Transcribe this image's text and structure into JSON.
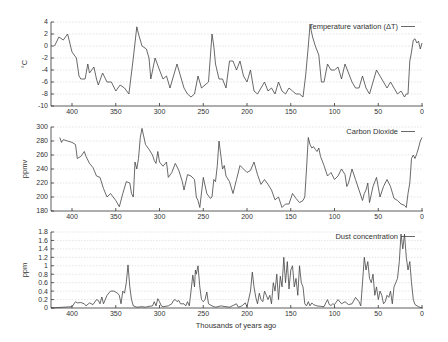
{
  "chart_data": [
    {
      "type": "line",
      "title": "",
      "legend": "Temperature variation (ΔT)",
      "xlabel": "",
      "ylabel": "°C",
      "xlim": [
        424,
        0
      ],
      "ylim": [
        -10,
        4
      ],
      "xticks": [
        400,
        350,
        300,
        250,
        200,
        150,
        100,
        50,
        0
      ],
      "yticks": [
        4,
        2,
        0,
        -2,
        -4,
        -6,
        -8,
        -10
      ],
      "grid": true,
      "legend_position": "top-right",
      "x": [
        420,
        415,
        410,
        405,
        400,
        395,
        392,
        390,
        385,
        382,
        380,
        375,
        372,
        370,
        365,
        360,
        355,
        350,
        345,
        340,
        335,
        330,
        326,
        324,
        320,
        315,
        312,
        310,
        305,
        300,
        296,
        292,
        288,
        285,
        280,
        276,
        272,
        268,
        264,
        260,
        256,
        252,
        248,
        244,
        240,
        238,
        236,
        232,
        228,
        224,
        220,
        216,
        212,
        208,
        204,
        200,
        196,
        192,
        188,
        184,
        180,
        176,
        172,
        168,
        164,
        160,
        156,
        152,
        148,
        144,
        140,
        136,
        133,
        130,
        128,
        125,
        122,
        118,
        115,
        112,
        108,
        104,
        100,
        96,
        92,
        88,
        84,
        80,
        76,
        72,
        68,
        64,
        60,
        56,
        52,
        48,
        44,
        40,
        36,
        32,
        28,
        24,
        20,
        18,
        16,
        14,
        12,
        10,
        8,
        6,
        4,
        2,
        0
      ],
      "values": [
        0,
        1.5,
        1,
        2,
        -1,
        -2,
        -5,
        -5.5,
        -5.5,
        -3,
        -4.5,
        -3.5,
        -5.5,
        -6.5,
        -4.5,
        -6,
        -6,
        -7.5,
        -6.5,
        -7,
        -8,
        -2,
        3.2,
        2,
        0,
        -0.5,
        -2,
        -5.5,
        -2,
        -4,
        -5.5,
        -5,
        -7,
        -5.5,
        -3,
        -5,
        -7,
        -8,
        -8.5,
        -8,
        -5,
        -7,
        -6.5,
        -6,
        2,
        0,
        -3,
        -5.5,
        -5.5,
        -7,
        -2.5,
        -2.5,
        -4,
        -2.5,
        -5,
        -6,
        -4,
        -7.5,
        -8,
        -7,
        -6,
        -7.5,
        -7,
        -8,
        -6,
        -7.5,
        -8,
        -7,
        -7.5,
        -8,
        -8,
        -8.5,
        -5,
        0,
        3.5,
        1.5,
        0,
        -1.5,
        -6,
        -6,
        -3,
        -4,
        -4,
        -3.5,
        -5.5,
        -3,
        -4.5,
        -6,
        -7,
        -7,
        -5,
        -7,
        -8,
        -6,
        -4,
        -5,
        -6,
        -7,
        -6,
        -7,
        -8,
        -7.5,
        -8.5,
        -8,
        -8,
        -2.5,
        -1,
        1,
        1.2,
        0.5,
        0.8,
        -0.5,
        0.5,
        0
      ]
    },
    {
      "type": "line",
      "title": "",
      "legend": "Carbon Dioxide",
      "xlabel": "",
      "ylabel": "ppmv",
      "xlim": [
        424,
        0
      ],
      "ylim": [
        180,
        300
      ],
      "xticks": [
        400,
        350,
        300,
        250,
        200,
        150,
        100,
        50,
        0
      ],
      "yticks": [
        300,
        280,
        260,
        240,
        220,
        200,
        180
      ],
      "grid": true,
      "legend_position": "top-right",
      "x": [
        414,
        412,
        410,
        405,
        400,
        396,
        394,
        390,
        386,
        384,
        380,
        376,
        372,
        368,
        364,
        360,
        356,
        350,
        346,
        342,
        338,
        334,
        332,
        330,
        328,
        326,
        324,
        322,
        320,
        316,
        312,
        308,
        306,
        304,
        302,
        300,
        296,
        292,
        290,
        286,
        282,
        278,
        274,
        272,
        268,
        264,
        260,
        258,
        256,
        254,
        250,
        246,
        242,
        240,
        238,
        236,
        234,
        232,
        230,
        228,
        226,
        224,
        220,
        216,
        212,
        208,
        204,
        200,
        196,
        192,
        188,
        184,
        180,
        176,
        172,
        168,
        164,
        160,
        156,
        152,
        148,
        144,
        140,
        136,
        134,
        132,
        130,
        128,
        126,
        124,
        122,
        120,
        118,
        116,
        112,
        108,
        104,
        100,
        96,
        92,
        88,
        86,
        84,
        80,
        76,
        72,
        68,
        66,
        64,
        62,
        60,
        56,
        52,
        48,
        44,
        40,
        36,
        32,
        28,
        24,
        20,
        18,
        16,
        14,
        12,
        10,
        8,
        6,
        4,
        2,
        0
      ],
      "values": [
        285,
        278,
        282,
        280,
        278,
        275,
        255,
        258,
        265,
        258,
        248,
        242,
        230,
        228,
        212,
        200,
        205,
        195,
        186,
        205,
        222,
        220,
        205,
        200,
        250,
        240,
        255,
        285,
        298,
        275,
        268,
        260,
        252,
        248,
        265,
        250,
        244,
        250,
        228,
        235,
        248,
        238,
        222,
        210,
        232,
        230,
        225,
        200,
        195,
        185,
        228,
        205,
        198,
        200,
        225,
        222,
        245,
        280,
        260,
        240,
        245,
        230,
        222,
        205,
        225,
        245,
        240,
        235,
        238,
        250,
        232,
        218,
        225,
        218,
        210,
        196,
        200,
        185,
        190,
        190,
        205,
        198,
        192,
        195,
        200,
        240,
        285,
        275,
        270,
        272,
        268,
        265,
        270,
        258,
        245,
        230,
        235,
        225,
        230,
        240,
        232,
        215,
        220,
        240,
        225,
        210,
        195,
        205,
        210,
        220,
        192,
        215,
        228,
        200,
        215,
        225,
        215,
        198,
        195,
        190,
        188,
        185,
        205,
        220,
        255,
        260,
        255,
        262,
        270,
        280,
        285
      ]
    },
    {
      "type": "line",
      "title": "",
      "legend": "Dust concentration",
      "xlabel": "Thousands of years ago",
      "ylabel": "ppm",
      "xlim": [
        424,
        0
      ],
      "ylim": [
        0,
        1.8
      ],
      "xticks": [
        400,
        350,
        300,
        250,
        200,
        150,
        100,
        50,
        0
      ],
      "yticks": [
        1.8,
        1.6,
        1.4,
        1.2,
        1,
        0.8,
        0.6,
        0.4,
        0.2,
        0
      ],
      "grid": true,
      "legend_position": "top-right",
      "x": [
        424,
        410,
        400,
        396,
        394,
        390,
        386,
        384,
        380,
        376,
        372,
        370,
        368,
        366,
        364,
        360,
        356,
        352,
        348,
        346,
        344,
        342,
        340,
        338,
        336,
        334,
        332,
        330,
        326,
        320,
        316,
        312,
        308,
        306,
        304,
        302,
        300,
        298,
        296,
        290,
        286,
        284,
        282,
        280,
        278,
        276,
        272,
        270,
        268,
        266,
        264,
        262,
        260,
        259,
        258,
        256,
        254,
        252,
        250,
        248,
        246,
        244,
        240,
        236,
        230,
        220,
        212,
        210,
        206,
        202,
        200,
        196,
        194,
        192,
        190,
        188,
        186,
        184,
        182,
        180,
        178,
        176,
        174,
        172,
        170,
        168,
        166,
        164,
        162,
        160,
        158,
        156,
        154,
        152,
        150,
        148,
        146,
        144,
        142,
        140,
        138,
        136,
        134,
        132,
        130,
        128,
        126,
        124,
        120,
        116,
        112,
        110,
        108,
        106,
        104,
        102,
        100,
        96,
        92,
        88,
        84,
        80,
        76,
        72,
        70,
        68,
        66,
        64,
        62,
        60,
        58,
        56,
        54,
        52,
        50,
        48,
        46,
        44,
        42,
        40,
        38,
        36,
        34,
        32,
        30,
        28,
        26,
        24,
        22,
        20,
        18,
        16,
        14,
        12,
        10,
        8,
        4,
        0
      ],
      "values": [
        0,
        0.02,
        0.03,
        0.15,
        0.12,
        0.13,
        0.1,
        0.05,
        0.12,
        0.08,
        0.2,
        0.18,
        0.1,
        0.26,
        0.1,
        0.3,
        0.4,
        0.4,
        0.35,
        0.3,
        0.1,
        0.4,
        0.35,
        0.6,
        1.02,
        0.5,
        0.2,
        0.05,
        0.02,
        0.03,
        0.02,
        0.04,
        0.05,
        0.15,
        0.05,
        0.22,
        0.15,
        0.05,
        0.03,
        0.05,
        0.1,
        0.18,
        0.2,
        0.15,
        0.18,
        0.1,
        0.1,
        0.05,
        0.15,
        0.05,
        0.4,
        0.78,
        0.5,
        0.9,
        0.8,
        1.0,
        0.5,
        0.2,
        0.15,
        0.2,
        0.38,
        0.1,
        0.05,
        0.02,
        0.05,
        0.02,
        0.1,
        0.02,
        0.05,
        0.12,
        0.03,
        0.4,
        0.85,
        0.5,
        0.25,
        0.1,
        0.35,
        0.2,
        0.15,
        0.4,
        0.3,
        0.2,
        0.3,
        0.1,
        0.6,
        0.4,
        0.8,
        0.2,
        0.75,
        0.5,
        1.2,
        0.6,
        1.1,
        0.45,
        0.9,
        1.0,
        0.5,
        0.7,
        0.3,
        1.0,
        0.6,
        0.5,
        0.1,
        0.05,
        0.15,
        0.05,
        0.12,
        0.08,
        0.05,
        0.04,
        0.03,
        0.12,
        0.2,
        0.08,
        0.06,
        0.1,
        0.08,
        0.2,
        0.1,
        0.15,
        0.08,
        0.1,
        0.25,
        0.15,
        0.05,
        0.6,
        1.2,
        0.9,
        1.1,
        0.7,
        0.6,
        0.8,
        0.3,
        0.5,
        0.2,
        0.4,
        0.3,
        0.1,
        0.15,
        0.3,
        0.25,
        0.4,
        0.1,
        0.5,
        0.6,
        0.7,
        1.1,
        1.75,
        1.4,
        1.75,
        1.2,
        0.9,
        1.1,
        0.6,
        0.2,
        0.08,
        0.03,
        0
      ]
    }
  ],
  "panels": [
    {
      "legend": "Temperature variation (ΔT)",
      "ylabel": "°C",
      "yticks": [
        "4",
        "2",
        "0",
        "-2",
        "-4",
        "-6",
        "-8",
        "-10"
      ],
      "xticks": [
        "400",
        "350",
        "300",
        "250",
        "200",
        "150",
        "100",
        "50",
        "0"
      ]
    },
    {
      "legend": "Carbon Dioxide",
      "ylabel": "ppmv",
      "yticks": [
        "300",
        "280",
        "260",
        "240",
        "220",
        "200",
        "180"
      ],
      "xticks": [
        "400",
        "350",
        "300",
        "250",
        "200",
        "150",
        "100",
        "50",
        "0"
      ]
    },
    {
      "legend": "Dust concentration",
      "ylabel": "ppm",
      "yticks": [
        "1.8",
        "1.6",
        "1.4",
        "1.2",
        "1",
        "0.8",
        "0.6",
        "0.4",
        "0.2",
        "0"
      ],
      "xticks": [
        "400",
        "350",
        "300",
        "250",
        "200",
        "150",
        "100",
        "50",
        "0"
      ]
    }
  ],
  "xlabel": "Thousands of years ago",
  "colors": {
    "line": "#444444",
    "grid": "#d4d4d4",
    "axis": "#333333",
    "text": "#333333"
  }
}
